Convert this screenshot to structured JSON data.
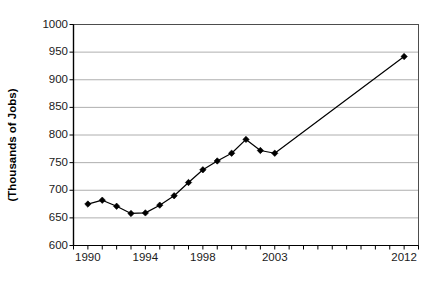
{
  "chart_data": {
    "type": "line",
    "title": "",
    "xlabel": "",
    "ylabel": "(Thousands of Jobs)",
    "xlim": [
      1989,
      2013
    ],
    "ylim": [
      600,
      1000
    ],
    "y_ticks": [
      600,
      650,
      700,
      750,
      800,
      850,
      900,
      950,
      1000
    ],
    "x_ticks": [
      1989,
      1990,
      1991,
      1992,
      1993,
      1994,
      1995,
      1996,
      1997,
      1998,
      1999,
      2000,
      2001,
      2002,
      2003,
      2004,
      2005,
      2006,
      2007,
      2008,
      2009,
      2010,
      2011,
      2012,
      2013
    ],
    "x_tick_labels": [
      {
        "x": 1990,
        "label": "1990"
      },
      {
        "x": 1994,
        "label": "1994"
      },
      {
        "x": 1998,
        "label": "1998"
      },
      {
        "x": 2003,
        "label": "2003"
      },
      {
        "x": 2012,
        "label": "2012"
      }
    ],
    "grid": "horizontal",
    "legend": "none",
    "series": [
      {
        "name": "Jobs",
        "marker": "diamond",
        "color": "#000000",
        "x": [
          1990,
          1991,
          1992,
          1993,
          1994,
          1995,
          1996,
          1997,
          1998,
          1999,
          2000,
          2001,
          2002,
          2003,
          2012
        ],
        "values": [
          675,
          682,
          671,
          658,
          659,
          673,
          690,
          714,
          737,
          753,
          767,
          792,
          772,
          767,
          942
        ]
      }
    ]
  },
  "axis": {
    "y_title": "(Thousands of Jobs)"
  }
}
